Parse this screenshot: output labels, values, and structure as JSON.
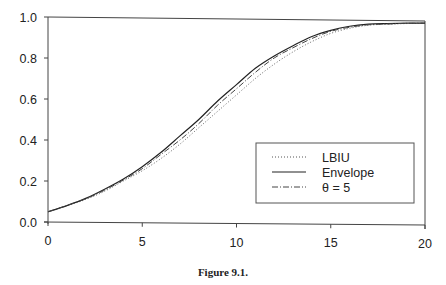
{
  "chart_data": {
    "type": "line",
    "title": "",
    "caption": "Figure 9.1.",
    "xlabel": "",
    "ylabel": "",
    "xlim": [
      0,
      20
    ],
    "ylim": [
      0,
      1.0
    ],
    "x_ticks": [
      "0",
      "5",
      "10",
      "15",
      "20"
    ],
    "y_ticks": [
      "0.0",
      "0.2",
      "0.4",
      "0.6",
      "0.8",
      "1.0"
    ],
    "grid": false,
    "legend_position": "lower right",
    "x": [
      0,
      1,
      2,
      3,
      4,
      5,
      6,
      7,
      8,
      9,
      10,
      11,
      12,
      13,
      14,
      15,
      16,
      17,
      18,
      19,
      20
    ],
    "series": [
      {
        "name": "LBIU",
        "style": "dotted",
        "values": [
          0.05,
          0.08,
          0.11,
          0.15,
          0.2,
          0.25,
          0.31,
          0.38,
          0.46,
          0.54,
          0.62,
          0.7,
          0.77,
          0.83,
          0.88,
          0.92,
          0.945,
          0.96,
          0.965,
          0.968,
          0.97
        ]
      },
      {
        "name": "Envelope",
        "style": "solid",
        "values": [
          0.05,
          0.08,
          0.115,
          0.16,
          0.21,
          0.27,
          0.34,
          0.42,
          0.5,
          0.59,
          0.67,
          0.75,
          0.81,
          0.86,
          0.905,
          0.935,
          0.955,
          0.965,
          0.968,
          0.97,
          0.97
        ]
      },
      {
        "name": "θ = 5",
        "style": "dash-dot",
        "values": [
          0.05,
          0.08,
          0.113,
          0.155,
          0.205,
          0.26,
          0.33,
          0.4,
          0.48,
          0.57,
          0.65,
          0.73,
          0.8,
          0.85,
          0.895,
          0.93,
          0.95,
          0.962,
          0.966,
          0.969,
          0.97
        ]
      }
    ]
  },
  "legend": {
    "items": [
      {
        "label": "LBIU"
      },
      {
        "label": "Envelope"
      },
      {
        "label": "θ = 5"
      }
    ]
  },
  "colors": {
    "line": "#333333",
    "axis": "#444444"
  }
}
